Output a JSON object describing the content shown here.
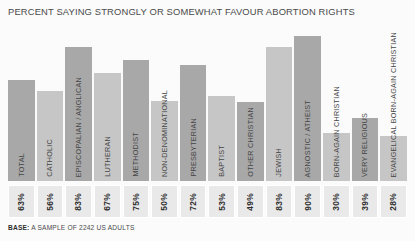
{
  "chart_data": {
    "type": "bar",
    "title": "PERCENT SAYING STRONGLY OR SOMEWHAT FAVOUR ABORTION RIGHTS",
    "xlabel": "",
    "ylabel": "",
    "ylim": [
      0,
      100
    ],
    "grid": false,
    "legend": "none",
    "categories": [
      "TOTAL",
      "CATHOLIC",
      "EPISCOPALIAN / ANGLICAN",
      "LUTHERAN",
      "METHODIST",
      "NON-DENOMINATIONAL",
      "PRESBYTERIAN",
      "BAPTIST",
      "OTHER CHRISTIAN",
      "JEWISH",
      "AGNOSTIC / ATHEIST",
      "BORN-AGAIN CHRISTIAN",
      "VERY RELIGIOUS",
      "EVANGELICAL BORN-AGAIN CHRISTIAN"
    ],
    "values": [
      63,
      56,
      83,
      67,
      75,
      50,
      72,
      53,
      49,
      83,
      90,
      30,
      39,
      28
    ],
    "value_labels": [
      "63%",
      "56%",
      "83%",
      "67%",
      "75%",
      "50%",
      "72%",
      "53%",
      "49%",
      "83%",
      "90%",
      "30%",
      "39%",
      "28%"
    ],
    "bar_colors": [
      "#a8a8a8",
      "#c6c6c6",
      "#a8a8a8",
      "#c6c6c6",
      "#a8a8a8",
      "#c6c6c6",
      "#a8a8a8",
      "#c6c6c6",
      "#a8a8a8",
      "#c6c6c6",
      "#a8a8a8",
      "#c6c6c6",
      "#a8a8a8",
      "#c6c6c6"
    ]
  },
  "footer": {
    "base_label": "BASE:",
    "base_text": " A SAMPLE OF 2242 US ADULTS"
  },
  "colors": {
    "background": "#fbfbfb",
    "bar_dark": "#a8a8a8",
    "bar_light": "#c6c6c6",
    "value_box_fill": "#e9e9e9",
    "text": "#4a4a4a"
  }
}
